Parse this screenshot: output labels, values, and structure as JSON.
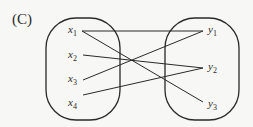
{
  "label": "(C)",
  "domain_set": {
    "name": "X",
    "elements": [
      {
        "var": "x",
        "sub": "1"
      },
      {
        "var": "x",
        "sub": "2"
      },
      {
        "var": "x",
        "sub": "3"
      },
      {
        "var": "x",
        "sub": "4"
      }
    ]
  },
  "codomain_set": {
    "name": "Y",
    "elements": [
      {
        "var": "y",
        "sub": "1"
      },
      {
        "var": "y",
        "sub": "2"
      },
      {
        "var": "y",
        "sub": "3"
      }
    ]
  },
  "mappings": [
    {
      "from": "x1",
      "to": "y1"
    },
    {
      "from": "x1",
      "to": "y3"
    },
    {
      "from": "x2",
      "to": "y2"
    },
    {
      "from": "x3",
      "to": "y1"
    },
    {
      "from": "x4",
      "to": "y2"
    }
  ],
  "colors": {
    "stroke": "#2a2a2a",
    "background": "#f7f7f5"
  }
}
